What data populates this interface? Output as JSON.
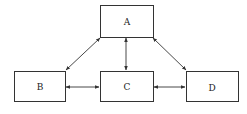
{
  "diagram": {
    "nodes": [
      {
        "id": "A",
        "label": "A"
      },
      {
        "id": "B",
        "label": "B"
      },
      {
        "id": "C",
        "label": "C"
      },
      {
        "id": "D",
        "label": "D"
      }
    ],
    "edges": [
      {
        "from": "A",
        "to": "B",
        "bidirectional": true
      },
      {
        "from": "A",
        "to": "C",
        "bidirectional": true
      },
      {
        "from": "A",
        "to": "D",
        "bidirectional": true
      },
      {
        "from": "B",
        "to": "C",
        "bidirectional": true
      },
      {
        "from": "C",
        "to": "D",
        "bidirectional": true
      }
    ]
  }
}
